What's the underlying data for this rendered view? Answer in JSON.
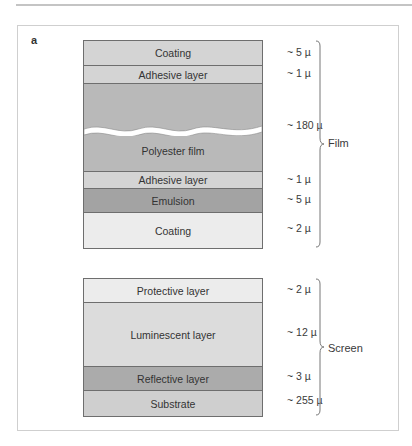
{
  "header": {
    "text": "…graphy"
  },
  "panel_label": "a",
  "film": {
    "group_label": "Film",
    "layers": [
      {
        "name": "Coating",
        "thickness": "~ 5 µ",
        "color": "#d4d4d4",
        "height": 25
      },
      {
        "name": "Adhesive layer",
        "thickness": "~ 1 µ",
        "color": "#d4d4d4",
        "height": 18
      },
      {
        "name": "Polyester film",
        "thickness": "~ 180 µ",
        "color": "#b9b9b9",
        "height": 88
      },
      {
        "name": "Adhesive layer",
        "thickness": "~ 1 µ",
        "color": "#d4d4d4",
        "height": 17
      },
      {
        "name": "Emulsion",
        "thickness": "~ 5 µ",
        "color": "#a3a3a3",
        "height": 24
      },
      {
        "name": "Coating",
        "thickness": "~ 2 µ",
        "color": "#ececec",
        "height": 35
      }
    ]
  },
  "screen": {
    "group_label": "Screen",
    "layers": [
      {
        "name": "Protective layer",
        "thickness": "~ 2 µ",
        "color": "#ececec",
        "height": 24
      },
      {
        "name": "Luminescent layer",
        "thickness": "~ 12 µ",
        "color": "#dcdcdc",
        "height": 64
      },
      {
        "name": "Reflective layer",
        "thickness": "~ 3 µ",
        "color": "#ababab",
        "height": 24
      },
      {
        "name": "Substrate",
        "thickness": "~ 255 µ",
        "color": "#cfcfcf",
        "height": 25
      }
    ]
  }
}
